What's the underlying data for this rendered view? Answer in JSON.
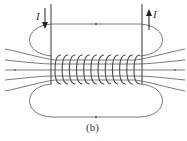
{
  "diagram": {
    "current_label_left": "I",
    "current_label_right": "I",
    "caption": "(b)",
    "coil_turns": 12,
    "colors": {
      "line": "#6b6b6b",
      "wire": "#4a4a4a",
      "arrow": "#222222"
    }
  }
}
